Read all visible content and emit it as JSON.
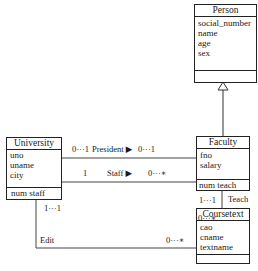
{
  "diagram": {
    "type": "UML class diagram",
    "classes": {
      "person": {
        "name": "Person",
        "attributes": [
          "social_number",
          "name",
          "age",
          "sex"
        ],
        "operations": []
      },
      "university": {
        "name": "University",
        "attributes": [
          "uno",
          "uname",
          "city"
        ],
        "operations": [
          "num staff"
        ]
      },
      "faculty": {
        "name": "Faculty",
        "attributes": [
          "fno",
          "salary"
        ],
        "operations": [
          "num teach"
        ]
      },
      "coursetext": {
        "name": "Coursetext",
        "attributes": [
          "cao",
          "cname",
          "textname"
        ],
        "operations": []
      }
    },
    "relations": {
      "generalization": {
        "from": "Faculty",
        "to": "Person"
      },
      "president": {
        "label": "President ▶",
        "mult_left": "0···1",
        "mult_right": "0···1"
      },
      "staff": {
        "label": "Staff ▶",
        "mult_left": "1",
        "mult_right": "0···∗"
      },
      "teach": {
        "label": "Teach",
        "mult_top": "1···1",
        "mult_bottom": "0···∗"
      },
      "edit": {
        "label": "Edit",
        "mult_top": "1···1",
        "mult_right": "0···∗"
      }
    }
  }
}
